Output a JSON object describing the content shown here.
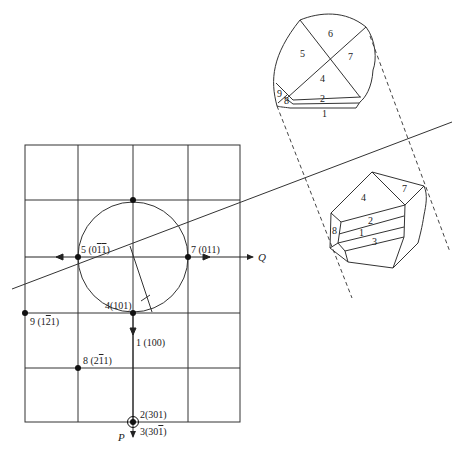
{
  "diagram": {
    "type": "gnomonic-projection-with-crystal-drawings",
    "colors": {
      "ink": "#222222",
      "background": "#ffffff"
    },
    "grid": {
      "columns_x": [
        25,
        78,
        133,
        188,
        240
      ],
      "rows_y": [
        145,
        200,
        257,
        313,
        368,
        422
      ]
    },
    "circle": {
      "cx": 133,
      "cy": 257,
      "r": 55
    },
    "axes": {
      "Q": {
        "label": "Q"
      },
      "P": {
        "label": "P"
      }
    },
    "poles": [
      {
        "id": "1",
        "index": "1",
        "hkl_html": "(100)",
        "label": "1 (100)"
      },
      {
        "id": "2",
        "index": "2",
        "label": "2(301)"
      },
      {
        "id": "3",
        "index": "3",
        "label_prefix": "3(30",
        "label_bar": "1",
        "label_suffix": ")"
      },
      {
        "id": "4",
        "index": "4",
        "label": "4(101)"
      },
      {
        "id": "5",
        "index": "5",
        "label_prefix": "5 (0",
        "label_bar": "1",
        "label_mid": "1",
        "label_suffix": ")"
      },
      {
        "id": "6",
        "index": "6",
        "label_prefix": "6 (",
        "label_bar": "1",
        "label_suffix": "01)"
      },
      {
        "id": "7",
        "index": "7",
        "label": "7 (011)"
      },
      {
        "id": "8",
        "index": "8",
        "label_prefix": "8 (2",
        "label_bar": "1",
        "label_suffix": "1)"
      },
      {
        "id": "9",
        "index": "9",
        "label_prefix": "9 (1",
        "label_bar": "2",
        "label_suffix": "1)"
      }
    ],
    "top_crystal": {
      "faces": [
        "1",
        "2",
        "4",
        "5",
        "6",
        "7",
        "8",
        "9"
      ]
    },
    "bottom_crystal": {
      "faces": [
        "1",
        "2",
        "3",
        "4",
        "7",
        "8"
      ]
    }
  }
}
